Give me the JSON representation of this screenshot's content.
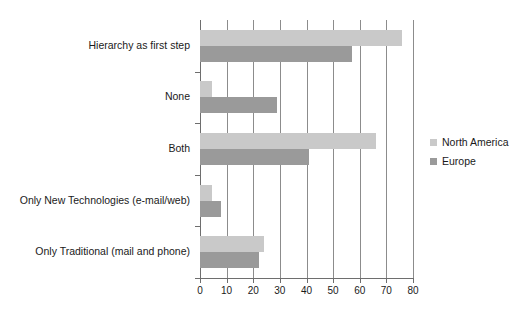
{
  "chart_data": {
    "type": "bar",
    "orientation": "horizontal",
    "title": "",
    "xlabel": "",
    "ylabel": "",
    "xlim": [
      0,
      80
    ],
    "xticks": [
      0,
      10,
      20,
      30,
      40,
      50,
      60,
      70,
      80
    ],
    "grid": "vertical",
    "legend_position": "right",
    "categories": [
      "Hierarchy as first step",
      "None",
      "Both",
      "Only New Technologies (e-mail/web)",
      "Only Traditional (mail and phone)"
    ],
    "series": [
      {
        "name": "North America",
        "color": "#c9c9c9",
        "values": [
          76,
          4.5,
          66,
          4.5,
          24
        ]
      },
      {
        "name": "Europe",
        "color": "#9a9a9a",
        "values": [
          57,
          29,
          41,
          8,
          22
        ]
      }
    ]
  },
  "legend": {
    "entries": [
      {
        "label": "North America",
        "color": "#c9c9c9"
      },
      {
        "label": "Europe",
        "color": "#9a9a9a"
      }
    ]
  },
  "axis": {
    "tick_labels": [
      "0",
      "10",
      "20",
      "30",
      "40",
      "50",
      "60",
      "70",
      "80"
    ]
  }
}
